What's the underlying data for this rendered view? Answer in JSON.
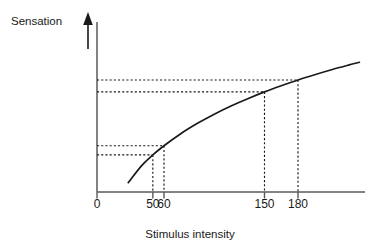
{
  "chart_data": {
    "type": "line",
    "title": "",
    "xlabel": "Stimulus intensity",
    "ylabel": "Sensation",
    "xlim": [
      0,
      240
    ],
    "ylim": [
      0,
      1
    ],
    "grid": false,
    "legend": null,
    "axis_style": {
      "y_axis_arrow": true,
      "y_axis_ticks": false,
      "x_axis_ticks": true,
      "curve_color": "#1a1a1a",
      "axis_color": "#4d4d4d",
      "guide_color": "#1a1a1a",
      "guide_style": "dashed"
    },
    "xticks": [
      {
        "value": 0,
        "label": "0"
      },
      {
        "value": 50,
        "label": "50"
      },
      {
        "value": 60,
        "label": "60"
      },
      {
        "value": 150,
        "label": "150"
      },
      {
        "value": 180,
        "label": "180"
      }
    ],
    "yticks": [],
    "series": [
      {
        "name": "Sensation vs stimulus intensity",
        "description": "Logarithmic, negatively accelerated psychophysical function",
        "x": [
          28,
          40,
          50,
          60,
          75,
          90,
          105,
          120,
          135,
          150,
          165,
          180,
          195,
          210,
          225,
          235
        ],
        "y": [
          0.055,
          0.155,
          0.218,
          0.272,
          0.343,
          0.404,
          0.458,
          0.506,
          0.549,
          0.589,
          0.625,
          0.659,
          0.69,
          0.719,
          0.746,
          0.763
        ]
      }
    ],
    "guides": [
      {
        "name": "guide-50",
        "x": 50,
        "y": 0.218,
        "x_label": "50"
      },
      {
        "name": "guide-60",
        "x": 60,
        "y": 0.272,
        "x_label": "60"
      },
      {
        "name": "guide-150",
        "x": 150,
        "y": 0.589,
        "x_label": "150"
      },
      {
        "name": "guide-180",
        "x": 180,
        "y": 0.659,
        "x_label": "180"
      }
    ],
    "annotations": [
      {
        "name": "jnd-low-pair",
        "text": "Pair of dashed reference levels for stimulus intensities 50 and 60"
      },
      {
        "name": "jnd-high-pair",
        "text": "Pair of dashed reference levels for stimulus intensities 150 and 180"
      }
    ]
  }
}
